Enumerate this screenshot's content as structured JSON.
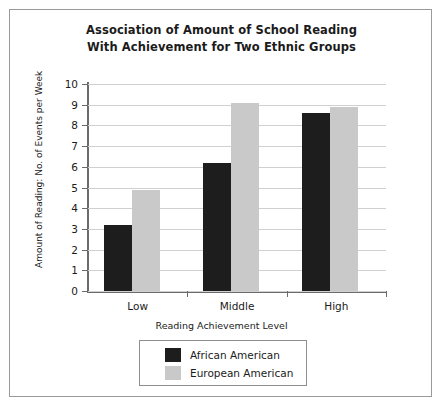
{
  "chart_data": {
    "type": "bar",
    "title": "Association of Amount of School Reading With Achievement for Two Ethnic Groups",
    "title_lines": [
      "Association of Amount of School Reading",
      "With Achievement for Two Ethnic Groups"
    ],
    "xlabel": "Reading Achievement Level",
    "ylabel": "Amount of Reading: No. of Events per Week",
    "categories": [
      "Low",
      "Middle",
      "High"
    ],
    "series": [
      {
        "name": "African American",
        "color": "#1d1d1d",
        "values": [
          3.2,
          6.2,
          8.6
        ]
      },
      {
        "name": "European American",
        "color": "#c9c9c9",
        "values": [
          4.9,
          9.1,
          8.9
        ]
      }
    ],
    "ylim": [
      0,
      10
    ],
    "ytick_labels": [
      "10",
      "9",
      "8",
      "7",
      "6",
      "5",
      "4",
      "3",
      "2",
      "1",
      "0"
    ],
    "ytick_values": [
      10,
      9,
      8,
      7,
      6,
      5,
      4,
      3,
      2,
      1,
      0
    ],
    "grid": "horizontal",
    "legend_position": "bottom-center"
  }
}
